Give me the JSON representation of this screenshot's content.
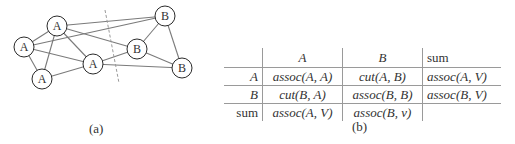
{
  "figure_a": {
    "caption": "(a)",
    "edge_color": "#7a7a7a",
    "node_stroke": "#2a2a2a",
    "node_radius": 10,
    "nodes": [
      {
        "id": "A1",
        "label": "A",
        "x": 57,
        "y": 26
      },
      {
        "id": "A2",
        "label": "A",
        "x": 24,
        "y": 47
      },
      {
        "id": "A3",
        "label": "A",
        "x": 42,
        "y": 79
      },
      {
        "id": "A4",
        "label": "A",
        "x": 93,
        "y": 64
      },
      {
        "id": "B1",
        "label": "B",
        "x": 165,
        "y": 16
      },
      {
        "id": "B2",
        "label": "B",
        "x": 137,
        "y": 49
      },
      {
        "id": "B3",
        "label": "B",
        "x": 182,
        "y": 68
      }
    ],
    "edges": [
      [
        "A1",
        "A2"
      ],
      [
        "A2",
        "A3"
      ],
      [
        "A1",
        "A3"
      ],
      [
        "A2",
        "A4"
      ],
      [
        "A3",
        "A4"
      ],
      [
        "A1",
        "A4"
      ],
      [
        "A1",
        "B1"
      ],
      [
        "A2",
        "B1"
      ],
      [
        "A1",
        "B2"
      ],
      [
        "A4",
        "B2"
      ],
      [
        "A4",
        "B3"
      ],
      [
        "B1",
        "B2"
      ],
      [
        "B1",
        "B3"
      ],
      [
        "B2",
        "B3"
      ]
    ],
    "cut_line": {
      "x1": 105,
      "y1": 10,
      "x2": 119,
      "y2": 83,
      "color": "#9a9a9a"
    }
  },
  "figure_b": {
    "caption": "(b)",
    "header": [
      "",
      "A",
      "B",
      "sum"
    ],
    "rows": [
      [
        "A",
        "assoc(A, A)",
        "cut(A, B)",
        "assoc(A, V)"
      ],
      [
        "B",
        "cut(B, A)",
        "assoc(B, B)",
        "assoc(B, V)"
      ],
      [
        "sum",
        "assoc(A, V)",
        "assoc(B, v)",
        ""
      ]
    ]
  }
}
